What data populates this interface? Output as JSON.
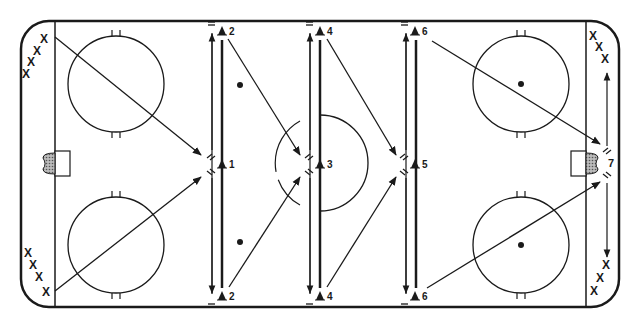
{
  "diagram": {
    "colors": {
      "line": "#1a1a1a",
      "background": "#ffffff",
      "net_fill": "#888888"
    },
    "rink": {
      "x": 21,
      "y": 21,
      "w": 598,
      "h": 286,
      "corner_radius": 28
    },
    "goal_lines_x": [
      55,
      586
    ],
    "faceoff_circles": [
      {
        "id": "left-top",
        "cx": 116,
        "cy": 84,
        "r": 48,
        "dot": false
      },
      {
        "id": "left-bottom",
        "cx": 116,
        "cy": 245,
        "r": 48,
        "dot": false
      },
      {
        "id": "right-top",
        "cx": 521,
        "cy": 84,
        "r": 48,
        "dot": true
      },
      {
        "id": "right-bottom",
        "cx": 521,
        "cy": 245,
        "r": 48,
        "dot": true
      }
    ],
    "neutral_dots": [
      {
        "cx": 240,
        "cy": 85
      },
      {
        "cx": 240,
        "cy": 242
      }
    ],
    "center_circle": {
      "cx": 320,
      "cy": 163,
      "r": 48
    },
    "nets": [
      {
        "id": "left-net",
        "x": 55,
        "y": 151,
        "side": "left"
      },
      {
        "id": "right-net",
        "x": 586,
        "y": 151,
        "side": "right"
      }
    ],
    "cones": [
      {
        "label": "2",
        "x": 222,
        "y": 31
      },
      {
        "label": "1",
        "x": 222,
        "y": 164
      },
      {
        "label": "2",
        "x": 222,
        "y": 296
      },
      {
        "label": "4",
        "x": 320,
        "y": 31
      },
      {
        "label": "3",
        "x": 320,
        "y": 164
      },
      {
        "label": "4",
        "x": 320,
        "y": 296
      },
      {
        "label": "6",
        "x": 415,
        "y": 31
      },
      {
        "label": "5",
        "x": 415,
        "y": 164
      },
      {
        "label": "6",
        "x": 415,
        "y": 296
      },
      {
        "label": "7",
        "x": 608,
        "y": 163
      }
    ],
    "player_groups": [
      {
        "id": "left-top-players",
        "marks": [
          "X",
          "X",
          "X",
          "X"
        ],
        "points": [
          [
            44,
            39
          ],
          [
            37,
            51
          ],
          [
            31,
            62
          ],
          [
            26,
            74
          ]
        ]
      },
      {
        "id": "left-bottom-players",
        "marks": [
          "X",
          "X",
          "X",
          "X"
        ],
        "points": [
          [
            28,
            253
          ],
          [
            33,
            265
          ],
          [
            39,
            277
          ],
          [
            46,
            292
          ]
        ]
      },
      {
        "id": "right-top-players",
        "marks": [
          "X",
          "X",
          "X"
        ],
        "points": [
          [
            593,
            36
          ],
          [
            599,
            47
          ],
          [
            605,
            59
          ]
        ]
      },
      {
        "id": "right-bottom-players",
        "marks": [
          "X",
          "X",
          "X"
        ],
        "points": [
          [
            606,
            265
          ],
          [
            600,
            278
          ],
          [
            594,
            291
          ]
        ]
      }
    ]
  }
}
